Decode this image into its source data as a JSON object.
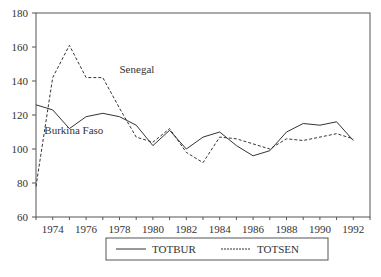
{
  "chart_data": {
    "type": "line",
    "title": "",
    "xlabel": "",
    "ylabel": "",
    "x": [
      1973,
      1974,
      1975,
      1976,
      1977,
      1978,
      1979,
      1980,
      1981,
      1982,
      1983,
      1984,
      1985,
      1986,
      1987,
      1988,
      1989,
      1990,
      1991,
      1992
    ],
    "series": [
      {
        "name": "TOTBUR",
        "style": "solid",
        "annotation": "Burkina Faso",
        "values": [
          126,
          123,
          112,
          119,
          121,
          119,
          114,
          102,
          111,
          100,
          107,
          110,
          102,
          96,
          99,
          110,
          115,
          114,
          116,
          105
        ]
      },
      {
        "name": "TOTSEN",
        "style": "dashed",
        "annotation": "Senegal",
        "values": [
          78,
          142,
          161,
          142,
          142,
          124,
          107,
          104,
          112,
          98,
          92,
          107,
          106,
          103,
          100,
          106,
          105,
          107,
          109,
          106
        ]
      }
    ],
    "ylim": [
      60,
      180
    ],
    "yticks": [
      60,
      80,
      100,
      120,
      140,
      160,
      180
    ],
    "xticks": [
      1974,
      1976,
      1978,
      1980,
      1982,
      1984,
      1986,
      1988,
      1990,
      1992
    ],
    "xlim": [
      1973,
      1993
    ],
    "grid": false,
    "legend_position": "bottom",
    "annotations": [
      {
        "text": "Senegal",
        "x": 1978,
        "y": 145
      },
      {
        "text": "Burkina Faso",
        "x": 1973.5,
        "y": 109
      }
    ]
  }
}
